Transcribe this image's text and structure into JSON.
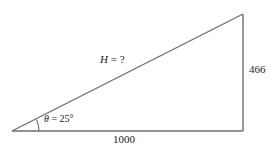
{
  "figure": {
    "kind": "right-triangle-trigonometry-diagram",
    "background_color": "#ffffff",
    "line_color": "#6e6e6e",
    "text_color": "#1a1a1a",
    "geometry": {
      "left_vertex": [
        12,
        131
      ],
      "apex_vertex": [
        243,
        14
      ],
      "right_angle_vertex": [
        243,
        131
      ],
      "angle_arc_center": [
        12,
        131
      ],
      "angle_arc_radius": 27
    },
    "labels": {
      "hypotenuse": {
        "variable": "H",
        "separator": " = ",
        "value": "?",
        "full": "H = ?"
      },
      "angle": {
        "variable": "θ",
        "separator": " = ",
        "value": "25°",
        "full": "θ = 25°"
      },
      "opposite_side": "466",
      "adjacent_side": "1000"
    }
  }
}
